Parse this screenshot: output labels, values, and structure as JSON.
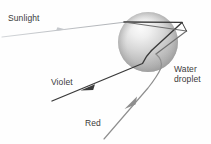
{
  "figure": {
    "background_color": "#fefefe",
    "labels": {
      "sunlight": "Sunlight",
      "violet": "Violet",
      "red": "Red",
      "water_droplet_line1": "Water",
      "water_droplet_line2": "droplet"
    },
    "colors": {
      "incident_ray": "#b9bcc0",
      "violet_ray": "#3a3a3a",
      "red_ray": "#8e8e8e",
      "droplet_light": "#f2f2f2",
      "droplet_mid": "#c9c9c9",
      "droplet_dark": "#9b9b9b",
      "text": "#3a3a3a"
    },
    "droplet": {
      "center_x": 148,
      "center_y": 42,
      "radius": 30
    },
    "rays": [
      {
        "name": "incident-sunlight-ray",
        "label": "Sunlight",
        "color": "#b9bcc0",
        "width": 1.1,
        "points": "2,37 124,22",
        "arrow_at": "62,30"
      },
      {
        "name": "violet-ray-inside-upper",
        "color": "#3a3a3a",
        "width": 1.3,
        "points": "124,22 182,22"
      },
      {
        "name": "violet-ray-inside-reflected",
        "color": "#3a3a3a",
        "width": 1.3,
        "points": "182,22 152,50"
      },
      {
        "name": "violet-ray-exit",
        "color": "#3a3a3a",
        "width": 1.3,
        "points": "152,50 143,63 52,101",
        "arrow_at": "88,86"
      },
      {
        "name": "red-ray-inside-upper",
        "color": "#8e8e8e",
        "width": 1.1,
        "points": "124,22 186,31"
      },
      {
        "name": "red-ray-inside-reflected",
        "color": "#8e8e8e",
        "width": 1.1,
        "points": "186,31 156,54"
      },
      {
        "name": "red-ray-exit",
        "color": "#8e8e8e",
        "width": 1.1,
        "points": "156,54 164,62 152,78 104,139",
        "arrow_at": "130,104"
      },
      {
        "name": "secondary-internal-ray",
        "color": "#3a3a3a",
        "width": 1.0,
        "points": "124,22 186,31"
      },
      {
        "name": "droplet-edge-chord",
        "color": "#3a3a3a",
        "width": 1.0,
        "points": "182,22 186,31"
      }
    ]
  }
}
